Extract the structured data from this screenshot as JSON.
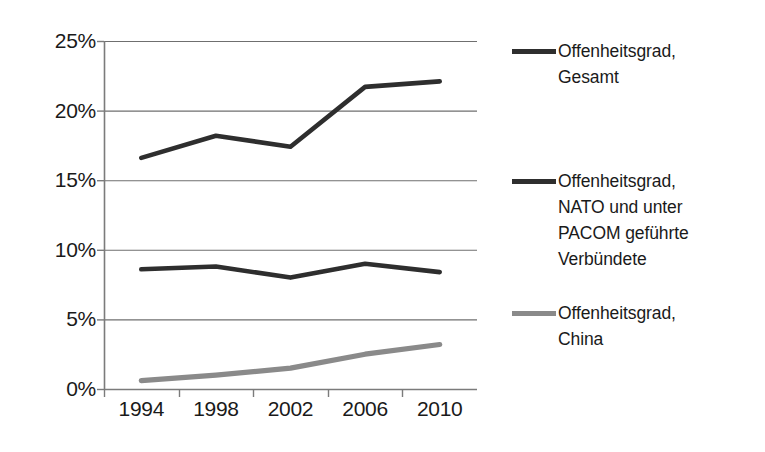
{
  "chart_data": {
    "type": "line",
    "title": "",
    "xlabel": "",
    "ylabel": "",
    "categories": [
      "1994",
      "1998",
      "2002",
      "2006",
      "2010"
    ],
    "ylim": [
      0,
      25
    ],
    "yticks": [
      "0%",
      "5%",
      "10%",
      "15%",
      "20%",
      "25%"
    ],
    "ytick_values": [
      0,
      5,
      10,
      15,
      20,
      25
    ],
    "grid": "horizontal",
    "legend_position": "right",
    "series": [
      {
        "name": "Offenheitsgrad, Gesamt",
        "color": "#2e2e2e",
        "values": [
          16.6,
          18.2,
          17.4,
          21.7,
          22.1
        ]
      },
      {
        "name": "Offenheitsgrad, NATO und  unter PACOM geführte Verbündete",
        "color": "#2e2e2e",
        "values": [
          8.6,
          8.8,
          8.0,
          9.0,
          8.4
        ]
      },
      {
        "name": "Offenheitsgrad, China",
        "color": "#8a8a8a",
        "values": [
          0.6,
          1.0,
          1.5,
          2.5,
          3.2
        ]
      }
    ]
  },
  "legend": {
    "items": [
      {
        "label": "Offenheitsgrad,\nGesamt",
        "color": "#2e2e2e",
        "style": "dark"
      },
      {
        "label": "Offenheitsgrad,\nNATO und  unter\nPACOM geführte\nVerbündete",
        "color": "#2e2e2e",
        "style": "dark"
      },
      {
        "label": "Offenheitsgrad,\nChina",
        "color": "#8a8a8a",
        "style": "gray"
      }
    ]
  }
}
